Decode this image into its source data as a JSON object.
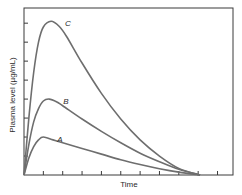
{
  "chart_data": {
    "type": "line",
    "title": "",
    "xlabel": "Time",
    "ylabel": "Plasma level (µg/mL)",
    "xlim": [
      0,
      10.8
    ],
    "ylim": [
      0,
      8.8
    ],
    "x_ticks": [
      1,
      2,
      3,
      4,
      5,
      6,
      7,
      8,
      9,
      10
    ],
    "y_ticks": [
      1,
      2,
      3,
      4,
      5,
      6,
      7,
      8
    ],
    "tick_labels_shown": false,
    "grid": false,
    "legend": "inline curve labels",
    "series": [
      {
        "name": "A",
        "color": "#6e6e6e",
        "peak": {
          "x": 1.0,
          "y": 2.0
        },
        "x": [
          0,
          0.25,
          0.5,
          0.75,
          1.0,
          1.5,
          2.0,
          3.0,
          4.0,
          5.0,
          6.0,
          7.0,
          8.0,
          9.1
        ],
        "values": [
          0,
          0.9,
          1.5,
          1.85,
          2.0,
          1.85,
          1.7,
          1.4,
          1.1,
          0.8,
          0.55,
          0.33,
          0.15,
          0
        ]
      },
      {
        "name": "B",
        "color": "#6e6e6e",
        "peak": {
          "x": 1.3,
          "y": 4.0
        },
        "x": [
          0,
          0.25,
          0.5,
          0.75,
          1.0,
          1.3,
          1.7,
          2.0,
          3.0,
          4.0,
          5.0,
          6.0,
          7.0,
          8.0,
          9.1
        ],
        "values": [
          0,
          1.6,
          2.8,
          3.5,
          3.9,
          4.0,
          3.85,
          3.65,
          2.95,
          2.3,
          1.7,
          1.15,
          0.7,
          0.3,
          0
        ]
      },
      {
        "name": "C",
        "color": "#6e6e6e",
        "peak": {
          "x": 1.4,
          "y": 8.1
        },
        "x": [
          0,
          0.25,
          0.5,
          0.75,
          1.0,
          1.4,
          1.8,
          2.2,
          3.0,
          4.0,
          5.0,
          6.0,
          7.0,
          8.0,
          9.1
        ],
        "values": [
          0,
          3.0,
          5.4,
          7.0,
          7.8,
          8.1,
          7.85,
          7.3,
          5.9,
          4.3,
          2.95,
          1.85,
          1.0,
          0.35,
          0
        ]
      }
    ]
  },
  "labels": {
    "x_axis": "Time",
    "y_axis": "Plasma level (µg/mL)",
    "curve_a": "A",
    "curve_b": "B",
    "curve_c": "C"
  },
  "colors": {
    "curve": "#6e6e6e",
    "axis": "#3a3a3a",
    "background": "#ffffff"
  }
}
